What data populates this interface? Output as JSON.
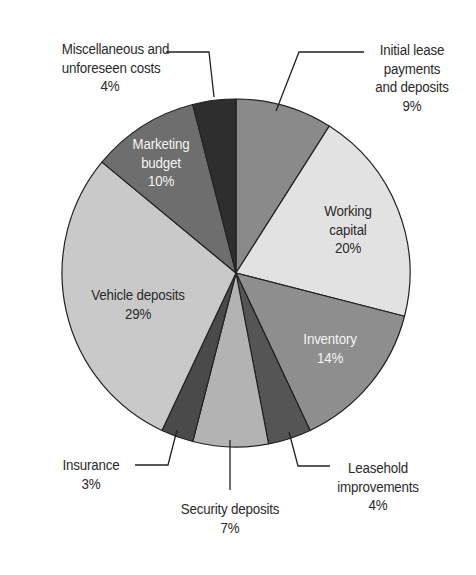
{
  "chart_data": {
    "type": "pie",
    "title": "",
    "start_angle_deg": 0,
    "direction": "clockwise",
    "center": [
      236,
      273
    ],
    "radius": 174,
    "slices": [
      {
        "label": "Initial lease payments and deposits",
        "value": 9,
        "display": "9%",
        "color": "#8a8a8a"
      },
      {
        "label": "Working capital",
        "value": 20,
        "display": "20%",
        "color": "#e2e2e2"
      },
      {
        "label": "Inventory",
        "value": 14,
        "display": "14%",
        "color": "#8e8e8e"
      },
      {
        "label": "Leasehold improvements",
        "value": 4,
        "display": "4%",
        "color": "#555555"
      },
      {
        "label": "Security deposits",
        "value": 7,
        "display": "7%",
        "color": "#b3b3b3"
      },
      {
        "label": "Insurance",
        "value": 3,
        "display": "3%",
        "color": "#4a4a4a"
      },
      {
        "label": "Vehicle deposits",
        "value": 29,
        "display": "29%",
        "color": "#c9c9c9"
      },
      {
        "label": "Marketing budget",
        "value": 10,
        "display": "10%",
        "color": "#6e6e6e"
      },
      {
        "label": "Miscellaneous and unforeseen costs",
        "value": 4,
        "display": "4%",
        "color": "#2e2e2e"
      }
    ]
  },
  "labels": {
    "initial_lease": {
      "line1": "Initial lease",
      "line2": "payments",
      "line3": "and deposits",
      "pct": "9%"
    },
    "working_capital": {
      "line1": "Working",
      "line2": "capital",
      "pct": "20%"
    },
    "inventory": {
      "line1": "Inventory",
      "pct": "14%"
    },
    "leasehold": {
      "line1": "Leasehold",
      "line2": "improvements",
      "pct": "4%"
    },
    "security": {
      "line1": "Security deposits",
      "pct": "7%"
    },
    "insurance": {
      "line1": "Insurance",
      "pct": "3%"
    },
    "vehicle": {
      "line1": "Vehicle deposits",
      "pct": "29%"
    },
    "marketing": {
      "line1": "Marketing",
      "line2": "budget",
      "pct": "10%"
    },
    "misc": {
      "line1": "Miscellaneous and",
      "line2": "unforeseen costs",
      "pct": "4%"
    }
  }
}
